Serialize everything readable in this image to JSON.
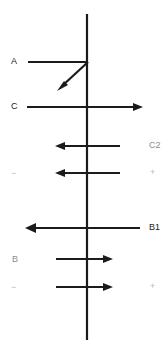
{
  "diagram": {
    "background_color": "#ffffff",
    "stroke_color": "#1b1b1b",
    "faint_color": "#b9b9b9",
    "mid_color": "#8d8d8d",
    "width": 165,
    "height": 353,
    "axis": {
      "name": "vertical-axis",
      "x": 87,
      "y_top": 14,
      "y_bottom": 340
    },
    "labels": {
      "a_left": "A",
      "c_left": "C",
      "c_right": "C",
      "c_right_sub": "2",
      "b_right": "B",
      "b_right_sub": "1",
      "b_left": "B",
      "minus_upper": "−",
      "plus_upper": "+",
      "minus_lower": "−",
      "plus_lower": "+"
    },
    "arrows": [
      {
        "id": "arrow-a",
        "label": "A",
        "direction": "right",
        "y": 62,
        "x_start": 28,
        "x_end": 88,
        "head": false
      },
      {
        "id": "arrow-a-diagonal",
        "label": "A-resultant",
        "direction": "down-left",
        "x_start": 88,
        "y_start": 62,
        "x_end": 58,
        "y_end": 90,
        "head": true
      },
      {
        "id": "arrow-c1",
        "label": "C",
        "direction": "right",
        "y": 107,
        "x_start": 27,
        "x_end": 140,
        "head": true
      },
      {
        "id": "arrow-c2",
        "label": "C2",
        "direction": "left",
        "y": 146,
        "x_start": 119,
        "x_end": 57,
        "head": true
      },
      {
        "id": "arrow-c3",
        "label": "",
        "direction": "left",
        "y": 173,
        "x_start": 119,
        "x_end": 57,
        "head": true
      },
      {
        "id": "arrow-b1",
        "label": "B1",
        "direction": "left",
        "y": 228,
        "x_start": 140,
        "x_end": 27,
        "head": true
      },
      {
        "id": "arrow-b2",
        "label": "B",
        "direction": "right",
        "y": 259,
        "x_start": 56,
        "x_end": 111,
        "head": true
      },
      {
        "id": "arrow-b3",
        "label": "",
        "direction": "right",
        "y": 287,
        "x_start": 56,
        "x_end": 111,
        "head": true
      }
    ]
  }
}
